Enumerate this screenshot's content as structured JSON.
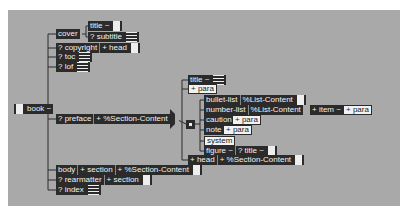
{
  "root": {
    "label": "book ~"
  },
  "children": {
    "cover": {
      "label": "cover",
      "items": [
        {
          "label": "title ~"
        },
        {
          "label": "? subtitle"
        }
      ]
    },
    "copyright": {
      "label": "? copyright",
      "child": "+ head"
    },
    "toc": {
      "label": "? toc"
    },
    "lof": {
      "label": "? lof"
    },
    "preface": {
      "label": "? preface",
      "child": "+ %Section-Content"
    },
    "body": {
      "label": "body",
      "child1": "+ section",
      "child2": "+ %Section-Content"
    },
    "rearmatter": {
      "label": "? rearmatter",
      "child": "+ section"
    },
    "index": {
      "label": "? index"
    }
  },
  "section_content": {
    "title": "title ~",
    "para": "+ para",
    "bullet_list": {
      "label": "bullet-list",
      "child": "%List-Content"
    },
    "number_list": {
      "label": "number-list",
      "child": "%List-Content",
      "item": "+ item ~",
      "item_child": "+ para"
    },
    "caution": {
      "label": "caution",
      "child": "+ para"
    },
    "note": {
      "label": "note",
      "child": "+ para"
    },
    "system": "system",
    "figure": {
      "label": "figure ~",
      "child": "? title ~"
    },
    "head": {
      "label": "+ head",
      "child": "+ %Section-Content"
    }
  }
}
